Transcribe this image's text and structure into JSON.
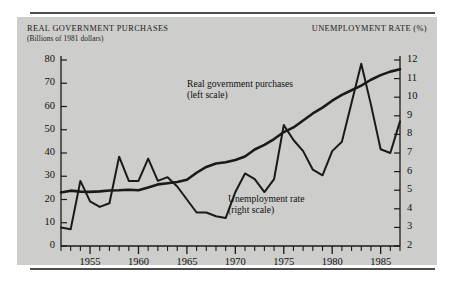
{
  "figure": {
    "background_color": "#ffffff",
    "panel_color": "#cdcdcb",
    "rule_color": "#4c4c4c",
    "line_color": "#1a1a1a"
  },
  "headers": {
    "left_title": "REAL GOVERNMENT PURCHASES",
    "left_subtitle": "(Billions of 1981 dollars)",
    "right_title": "UNEMPLOYMENT RATE (%)"
  },
  "annotations": [
    {
      "id": "gov",
      "line1": "Real government purchases",
      "line2": "(left scale)"
    },
    {
      "id": "unemp",
      "line1": "Unemployment rate",
      "line2": "(right scale)"
    }
  ],
  "axes": {
    "left": {
      "title": "REAL GOVERNMENT PURCHASES",
      "unit": "Billions of 1981 dollars",
      "min": 0,
      "max": 80,
      "step": 10,
      "ticks": [
        0,
        10,
        20,
        30,
        40,
        50,
        60,
        70,
        80
      ]
    },
    "right": {
      "title": "UNEMPLOYMENT RATE (%)",
      "unit": "percent",
      "min": 2,
      "max": 12,
      "step": 1,
      "ticks": [
        2,
        3,
        4,
        5,
        6,
        7,
        8,
        9,
        10,
        11,
        12
      ]
    },
    "bottom": {
      "min": 1952,
      "max": 1987,
      "labeled_ticks": [
        1955,
        1960,
        1965,
        1970,
        1975,
        1980,
        1985
      ],
      "minor_tick_interval": 1
    }
  },
  "chart_data": {
    "type": "line",
    "title": "",
    "subtitle": "",
    "xlabel": "",
    "ylabel": "Billions of 1981 dollars",
    "y2label": "Unemployment rate (%)",
    "xlim": [
      1952,
      1987
    ],
    "ylim": [
      0,
      80
    ],
    "y2lim": [
      2,
      12
    ],
    "grid": false,
    "legend": "inline-annotations",
    "x": [
      1952,
      1953,
      1954,
      1955,
      1956,
      1957,
      1958,
      1959,
      1960,
      1961,
      1962,
      1963,
      1964,
      1965,
      1966,
      1967,
      1968,
      1969,
      1970,
      1971,
      1972,
      1973,
      1974,
      1975,
      1976,
      1977,
      1978,
      1979,
      1980,
      1981,
      1982,
      1983,
      1984,
      1985,
      1986,
      1987
    ],
    "series": [
      {
        "name": "Real government purchases",
        "axis": "left",
        "unit": "Billions of 1981 dollars",
        "values": [
          23.0,
          23.8,
          23.4,
          23.3,
          23.5,
          23.9,
          24.0,
          24.2,
          24.0,
          25.2,
          26.5,
          27.0,
          27.5,
          28.5,
          31.5,
          34.0,
          35.5,
          36.0,
          37.0,
          38.5,
          41.5,
          43.5,
          46.0,
          49.0,
          51.0,
          54.0,
          57.0,
          59.5,
          62.5,
          65.0,
          67.0,
          69.0,
          71.5,
          73.5,
          75.0,
          76.0
        ]
      },
      {
        "name": "Unemployment rate",
        "axis": "right",
        "unit": "percent",
        "values": [
          3.0,
          2.9,
          5.5,
          4.4,
          4.1,
          4.3,
          6.8,
          5.5,
          5.5,
          6.7,
          5.5,
          5.7,
          5.2,
          4.5,
          3.8,
          3.8,
          3.6,
          3.5,
          4.9,
          5.9,
          5.6,
          4.9,
          5.6,
          8.5,
          7.7,
          7.1,
          6.1,
          5.8,
          7.1,
          7.6,
          9.7,
          11.8,
          9.6,
          7.2,
          7.0,
          8.7
        ]
      }
    ]
  }
}
